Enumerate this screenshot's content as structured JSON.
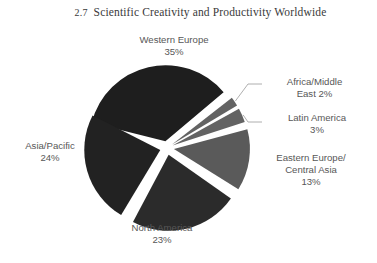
{
  "title": {
    "number": "2.7",
    "text": "Scientific Creativity and Productivity Worldwide",
    "full": "2.7  Scientific Creativity and Productivity Worldwide"
  },
  "chart_data": {
    "type": "pie",
    "categories": [
      "Western Europe",
      "Africa/Middle East",
      "Latin America",
      "Eastern Europe/Central Asia",
      "North America",
      "Asia/Pacific"
    ],
    "values": [
      35,
      2,
      3,
      13,
      23,
      24
    ],
    "unit": "%",
    "exploded": true,
    "legend": "none",
    "grid": false,
    "colors": [
      "#1e1e1e",
      "#636363",
      "#636363",
      "#5a5a5a",
      "#2b2b2b",
      "#222222"
    ],
    "slices": [
      {
        "name": "Western Europe",
        "value": 35,
        "label_line1": "Western Europe",
        "label_line2": "35%",
        "color": "#1e1e1e",
        "start_angle": -76,
        "end_angle": 50,
        "explode": 7,
        "leader": false
      },
      {
        "name": "Africa/Middle East",
        "value": 2,
        "label_line1": "Africa/Middle",
        "label_line2": "East 2%",
        "color": "#636363",
        "start_angle": 52,
        "end_angle": 59,
        "explode": 6,
        "leader": true
      },
      {
        "name": "Latin America",
        "value": 3,
        "label_line1": "Latin America",
        "label_line2": "3%",
        "color": "#636363",
        "start_angle": 61,
        "end_angle": 72,
        "explode": 6,
        "leader": true
      },
      {
        "name": "Eastern Europe/Central Asia",
        "value": 13,
        "label_line1": "Eastern Europe/",
        "label_line2": "Central Asia",
        "label_line3": "13%",
        "color": "#5a5a5a",
        "start_angle": 75,
        "end_angle": 122,
        "explode": 7,
        "leader": false
      },
      {
        "name": "North America",
        "value": 23,
        "label_line1": "North America",
        "label_line2": "23%",
        "color": "#2b2b2b",
        "start_angle": 125,
        "end_angle": 208,
        "explode": 7,
        "leader": false
      },
      {
        "name": "Asia/Pacific",
        "value": 24,
        "label_line1": "Asia/Pacific",
        "label_line2": "24%",
        "color": "#222222",
        "start_angle": 211,
        "end_angle": 297,
        "explode": 7,
        "leader": false
      }
    ],
    "geometry": {
      "cx": 167,
      "cy": 148,
      "radius": 76
    }
  },
  "labels": {
    "western_europe": "Western Europe\n35%",
    "asia_pacific": "Asia/Pacific\n24%",
    "north_america": "North America\n23%",
    "africa_middle_east": "Africa/Middle\nEast 2%",
    "latin_america": "Latin America\n3%",
    "eastern_europe": "Eastern Europe/\nCentral Asia\n13%"
  }
}
